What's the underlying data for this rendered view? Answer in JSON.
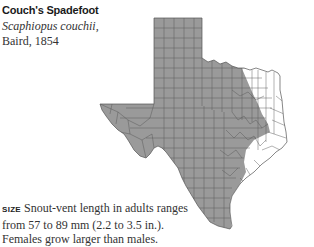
{
  "species": {
    "common_name": "Couch's Spadefoot",
    "scientific_name": "Scaphiopus couchii,",
    "authority": "Baird, 1854"
  },
  "map": {
    "region": "Texas",
    "legend": "Shaded counties indicate range",
    "range_color": "#9a9a9a",
    "county_line_color": "#555555",
    "background_color": "#ffffff"
  },
  "size_info": {
    "label": "SIZE",
    "text": "Snout-vent length in adults ranges from 57 to 89 mm (2.2 to 3.5 in.). Females grow larger than males."
  }
}
